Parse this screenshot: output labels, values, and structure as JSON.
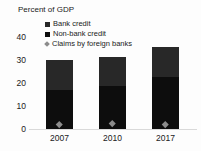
{
  "chart_data": {
    "type": "bar",
    "subtype": "stacked-bars-with-point-markers",
    "title": "Percent of GDP",
    "categories": [
      "2007",
      "2010",
      "2017"
    ],
    "series": [
      {
        "name": "Bank credit",
        "render": "bar",
        "stack_position": "top",
        "color": "#282828",
        "values": [
          13,
          13,
          13
        ]
      },
      {
        "name": "Non-bank credit",
        "render": "bar",
        "stack_position": "bottom",
        "color": "#0d0d0d",
        "values": [
          17,
          18.5,
          22.5
        ]
      },
      {
        "name": "Claims by foreign banks",
        "render": "point",
        "marker": "diamond",
        "color": "#8c8c8c",
        "values": [
          2,
          2.5,
          2
        ]
      }
    ],
    "stacked_totals": [
      30,
      31.5,
      35.5
    ],
    "ylim": [
      0,
      40
    ],
    "yticks": [
      0,
      10,
      20,
      30,
      40
    ],
    "xlabel": "",
    "ylabel": "",
    "grid": false,
    "legend_position": "top-left-inside",
    "colors": {
      "axis_line": "#d9d9d9",
      "text": "#1a1a1a",
      "background": "#fdfdfd"
    }
  }
}
